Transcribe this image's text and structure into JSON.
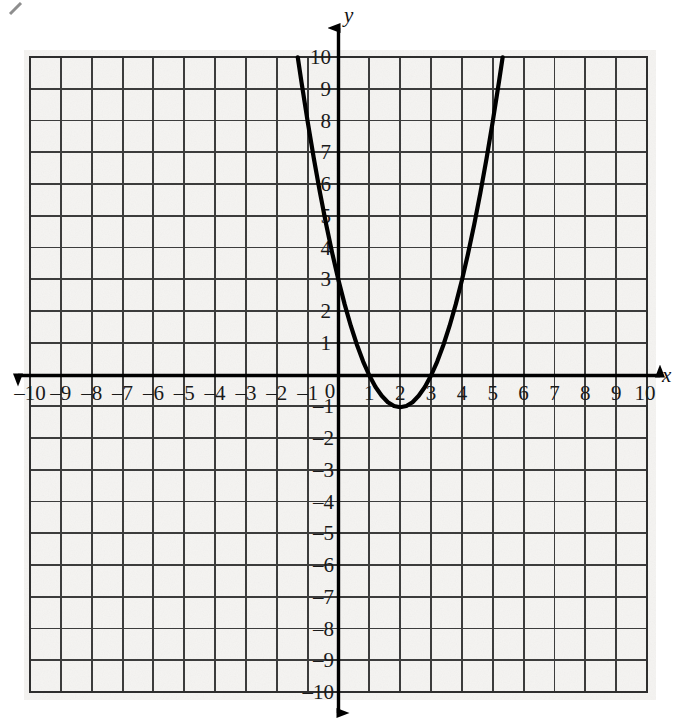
{
  "figure": {
    "background_color": "#ffffff",
    "paper_color": "#f5f4f2",
    "grid_color": "#3c3c3c",
    "axis_color": "#000000",
    "curve_color": "#000000"
  },
  "axes": {
    "x_axis_name": "x",
    "y_axis_name": "y",
    "origin_label": "0",
    "x_labels": [
      "–10",
      "–9",
      "–8",
      "–7",
      "–6",
      "–5",
      "–4",
      "–3",
      "–2",
      "–1",
      "1",
      "2",
      "3",
      "4",
      "5",
      "6",
      "7",
      "8",
      "9",
      "10"
    ],
    "y_labels": [
      "10",
      "9",
      "8",
      "7",
      "6",
      "5",
      "4",
      "3",
      "2",
      "1",
      "–1",
      "–2",
      "–3",
      "–4",
      "–5",
      "–6",
      "–7",
      "–8",
      "–9",
      "–10"
    ]
  },
  "chart_data": {
    "type": "line",
    "title": "",
    "xlabel": "x",
    "ylabel": "y",
    "xlim": [
      -10,
      10
    ],
    "ylim": [
      -10,
      10
    ],
    "x_tick_step": 1,
    "y_tick_step": 1,
    "grid": true,
    "legend": "none",
    "series": [
      {
        "name": "y = (x - 2)^2 - 1",
        "equation": "y = x^2 - 4x + 3",
        "vertex": [
          2,
          -1
        ],
        "x_intercepts": [
          1,
          3
        ],
        "y_intercept": 3,
        "axis_of_symmetry": 2,
        "opens": "up",
        "x": [
          -1.32,
          -1.2,
          -1.0,
          -0.8,
          -0.6,
          -0.4,
          -0.2,
          0.0,
          0.2,
          0.4,
          0.6,
          0.8,
          1.0,
          1.2,
          1.4,
          1.6,
          1.8,
          2.0,
          2.2,
          2.4,
          2.6,
          2.8,
          3.0,
          3.2,
          3.4,
          3.6,
          3.8,
          4.0,
          4.2,
          4.4,
          4.6,
          4.8,
          5.0,
          5.2,
          5.32
        ],
        "y": [
          10.02,
          9.24,
          8.0,
          6.84,
          5.76,
          4.76,
          3.84,
          3.0,
          2.24,
          1.56,
          0.96,
          0.44,
          0.0,
          -0.36,
          -0.64,
          -0.84,
          -0.96,
          -1.0,
          -0.96,
          -0.84,
          -0.64,
          -0.36,
          0.0,
          0.44,
          0.96,
          1.56,
          2.24,
          3.0,
          3.84,
          4.76,
          5.76,
          6.84,
          8.0,
          9.24,
          10.02
        ]
      }
    ]
  }
}
